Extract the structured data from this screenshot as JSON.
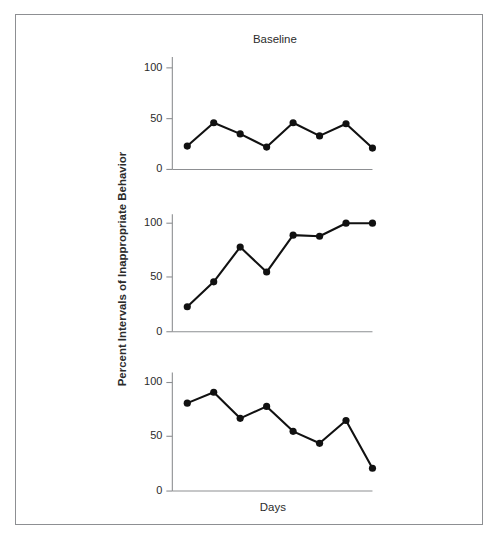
{
  "figure": {
    "title": "Baseline",
    "xlabel": "Days",
    "ylabel": "Percent Intervals of Inappropriate Behavior",
    "frame_color": "#8d8f92",
    "series_color": "#111111"
  },
  "ticks": {
    "t0": "0",
    "t50": "50",
    "t100": "100"
  },
  "chart_data": {
    "type": "line",
    "title": "Baseline",
    "xlabel": "Days",
    "ylabel": "Percent Intervals of Inappropriate Behavior",
    "ylim": [
      0,
      115
    ],
    "yticks": [
      0,
      50,
      100
    ],
    "grid": false,
    "legend": "none",
    "layout": "3 stacked panels sharing x-axis (multiple-baseline design)",
    "x": [
      1,
      2,
      3,
      4,
      5,
      6,
      7,
      8
    ],
    "panels": [
      {
        "name": "panel-top",
        "title": "Baseline",
        "values": [
          23,
          46,
          35,
          22,
          46,
          33,
          45,
          21
        ]
      },
      {
        "name": "panel-middle",
        "title": "",
        "values": [
          23,
          46,
          78,
          55,
          89,
          88,
          100,
          100
        ]
      },
      {
        "name": "panel-bottom",
        "title": "",
        "values": [
          81,
          91,
          67,
          78,
          55,
          44,
          65,
          21
        ]
      }
    ],
    "series": [
      {
        "name": "Panel 1 (top)",
        "values": [
          23,
          46,
          35,
          22,
          46,
          33,
          45,
          21
        ]
      },
      {
        "name": "Panel 2 (middle)",
        "values": [
          23,
          46,
          78,
          55,
          89,
          88,
          100,
          100
        ]
      },
      {
        "name": "Panel 3 (bottom)",
        "values": [
          81,
          91,
          67,
          78,
          55,
          44,
          65,
          21
        ]
      }
    ]
  }
}
